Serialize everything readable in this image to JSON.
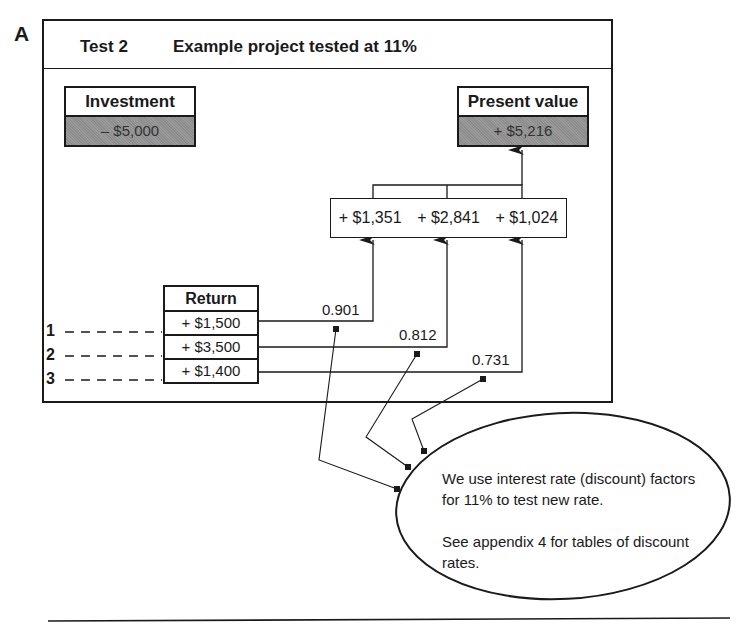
{
  "panel_label": "A",
  "header": {
    "test_label": "Test 2",
    "title": "Example project tested at 11%"
  },
  "investment": {
    "label": "Investment",
    "value": "– $5,000"
  },
  "present_value": {
    "label": "Present value",
    "value": "+ $5,216"
  },
  "discounted_values": [
    "+ $1,351",
    "+ $2,841",
    "+ $1,024"
  ],
  "returns": {
    "header": "Return",
    "rows": [
      {
        "year": "1",
        "value": "+ $1,500",
        "factor": "0.901"
      },
      {
        "year": "2",
        "value": "+ $3,500",
        "factor": "0.812"
      },
      {
        "year": "3",
        "value": "+ $1,400",
        "factor": "0.731"
      }
    ]
  },
  "note": {
    "line1": "We use interest rate (discount) factors for 11% to test new rate.",
    "line2": "See appendix 4 for tables of discount rates."
  },
  "colors": {
    "ink": "#1a1a1a",
    "shade": "#939393",
    "background": "#ffffff"
  }
}
